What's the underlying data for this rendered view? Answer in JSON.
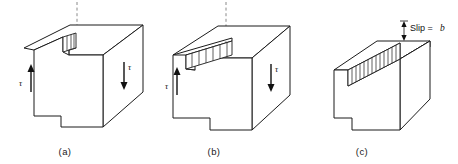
{
  "figure": {
    "background_color": "#ffffff",
    "line_color": "#1b1b1b",
    "dashed_line_color": "#7d7d7d",
    "panels": [
      {
        "id": "a",
        "caption": "(a)",
        "stage": "slip nucleated at left face",
        "shear_labels": [
          {
            "symbol": "τ",
            "position": "left",
            "arrow_direction": "up"
          },
          {
            "symbol": "τ",
            "position": "right",
            "arrow_direction": "down"
          }
        ],
        "slip_band": {
          "hatch_count": 2,
          "extent": "small"
        },
        "has_dashed_guide": true,
        "has_bottom_step": true
      },
      {
        "id": "b",
        "caption": "(b)",
        "stage": "dislocation partway through crystal",
        "shear_labels": [
          {
            "symbol": "τ",
            "position": "left",
            "arrow_direction": "up"
          },
          {
            "symbol": "τ",
            "position": "right",
            "arrow_direction": "down"
          }
        ],
        "slip_band": {
          "hatch_count": 6,
          "extent": "partial"
        },
        "has_dashed_guide": true,
        "has_bottom_step": true
      },
      {
        "id": "c",
        "caption": "(c)",
        "stage": "dislocation has passed completely through",
        "shear_labels": [],
        "slip_band": {
          "hatch_count": 13,
          "extent": "full"
        },
        "has_dashed_guide": false,
        "has_bottom_step": true,
        "annotation": {
          "text_plain": "Slip = ",
          "text_italic": "b",
          "full_text": "Slip = b",
          "marker": "double-headed-vertical-arrow"
        }
      }
    ]
  }
}
